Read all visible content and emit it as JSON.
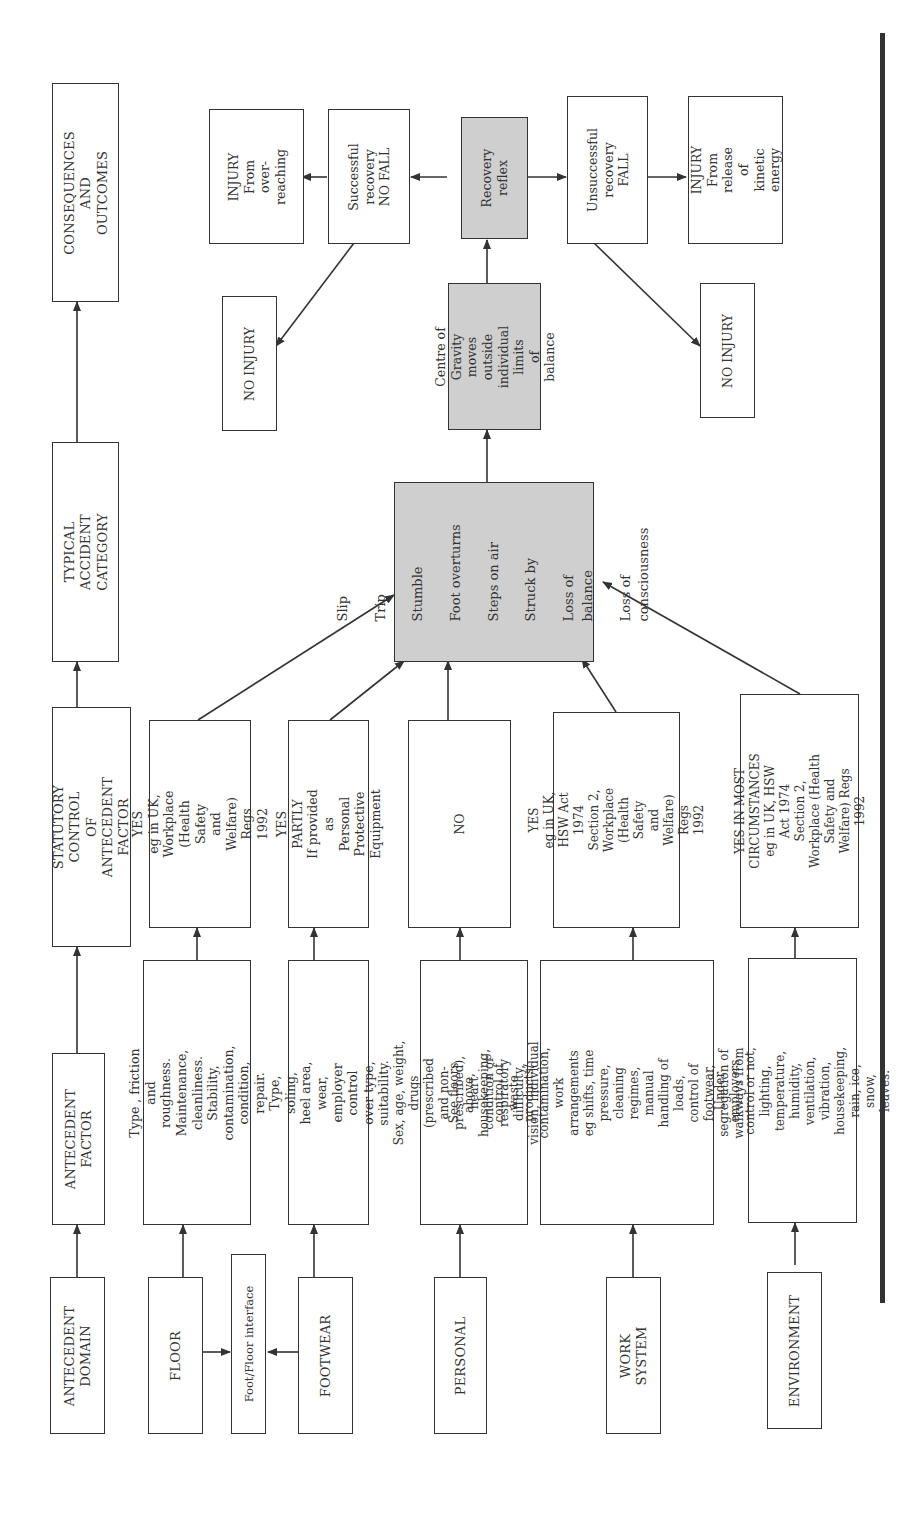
{
  "header_row": {
    "consequences": "CONSEQUENCES AND\nOUTCOMES",
    "typical_accident": "TYPICAL ACCIDENT\nCATEGORY",
    "statutory_control": "STATUTORY CONTROL\nOF ANTECEDENT FACTOR",
    "antecedent_factor": "ANTECEDENT\nFACTOR",
    "antecedent_domain": "ANTECEDENT\nDOMAIN"
  },
  "domains": {
    "floor": "FLOOR",
    "foot_floor_interface": "Foot/Floor interface",
    "footwear": "FOOTWEAR",
    "personal": "PERSONAL",
    "work_system": "WORK SYSTEM",
    "environment": "ENVIRONMENT"
  },
  "factors": {
    "floor": "Type , friction and roughness.\nMaintenance, cleanliness.\nStability, contamination,\ncondition, repair.",
    "footwear": "Type, soling, heel area, wear,\nemployer control over type,\nsuitability.",
    "personal": "Sex, age, weight, drugs (prescribed\nand non-prescribed), heart\ncondition or respiratory difficulty,\nvision, individual anthropometrics.",
    "work_system": "See floors above, housekeeping,\ncontrol of waste products/\ncontamination, work arrangements\neg shifts, time pressure, cleaning\nregimes, manual handling of loads,\ncontrol of footwear, segregation of\nwalkways from transportation.\nSafety culture and management.",
    "environment": "Under employers control or not,\nlighting, temperature, humidity,\nventilation, vibration,\nhousekeeping, rain, ice, snow,\nleaves."
  },
  "statutory": {
    "floor": "YES\neg in UK, Workplace\n(Health Safety and\nWelfare) Regs 1992",
    "footwear": "YES PARTLY\nIf provided as Personal\nProtective Equipment",
    "personal": "NO",
    "work_system": "YES\neg in UK, HSW Act 1974\nSection 2, Workplace (Health\nSafety and Welfare) Regs 1992",
    "environment": "YES IN MOST\nCIRCUMSTANCES\neg in UK, HSW Act 1974\nSection 2, Workplace (Health\nSafety and Welfare) Regs 1992"
  },
  "accident_categories": {
    "items": [
      "Slip",
      "Trip",
      "Stumble",
      "Foot overturns",
      "Steps on air",
      "Struck by",
      "Loss of balance",
      "Loss of consciousness"
    ]
  },
  "outcomes": {
    "centre_of_gravity": "Centre of Gravity\nmoves outside\nindividual limits\nof balance",
    "recovery_reflex": "Recovery\nreflex",
    "successful_recovery": "Successful\nrecovery\nNO FALL",
    "unsuccessful_recovery": "Unsuccessful\nrecovery FALL",
    "injury_overreaching": "INJURY\nFrom over-\nreaching",
    "injury_kinetic": "INJURY\nFrom release of\nkinetic energy",
    "no_injury_left": "NO INJURY",
    "no_injury_right": "NO INJURY"
  },
  "colors": {
    "line": "#333333",
    "shaded_fill": "#cfcfcf"
  }
}
